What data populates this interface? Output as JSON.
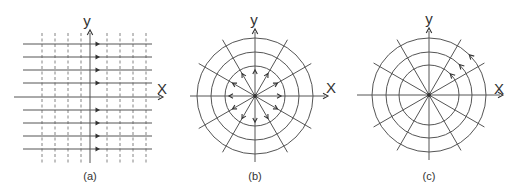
{
  "figure": {
    "width": 520,
    "height": 189,
    "colors": {
      "line": "#555555",
      "dashed": "#777777",
      "arrow": "#333333",
      "text": "#333333",
      "background": "#ffffff"
    }
  },
  "panels": [
    {
      "id": "a",
      "caption": "(a)",
      "description": "Uniform parallel flow: horizontal streamlines with arrows pointing in +x direction, dashed vertical equipotential lines",
      "x_label": "X",
      "y_label": "y",
      "origin": [
        90,
        97
      ],
      "x_axis": {
        "from": 14,
        "to": 163
      },
      "y_axis": {
        "from": 163,
        "to": 30
      },
      "streamlines_y": [
        44,
        57,
        70,
        83,
        110,
        123,
        136,
        149
      ],
      "streamline_span": [
        23,
        152
      ],
      "arrow_x": 97,
      "equipotential_x": [
        42,
        55,
        68,
        81,
        107,
        120,
        133,
        146
      ],
      "equipotential_span": [
        33,
        165
      ],
      "label_positions": {
        "y": [
          87,
          20
        ],
        "x": [
          162,
          88
        ],
        "caption": [
          90,
          176
        ]
      }
    },
    {
      "id": "b",
      "caption": "(b)",
      "description": "Source flow: radial streamlines with outward-pointing arrows, concentric circular equipotential lines",
      "x_label": "X",
      "y_label": "y",
      "center": [
        255,
        96
      ],
      "radii": [
        30,
        44,
        58
      ],
      "radial_length": 65,
      "radial_angles_deg": [
        0,
        30,
        60,
        90,
        120,
        150,
        180,
        210,
        240,
        270,
        300,
        330
      ],
      "arrow_radius": 26,
      "arrow_direction": "outward",
      "x_axis": {
        "from": 190,
        "to": 328
      },
      "y_axis": {
        "from": 162,
        "to": 29
      },
      "label_positions": {
        "y": [
          254,
          19
        ],
        "x": [
          331,
          87
        ],
        "caption": [
          255,
          176
        ]
      }
    },
    {
      "id": "c",
      "caption": "(c)",
      "description": "Vortex flow: circular streamlines with counterclockwise arrows, radial equipotential lines",
      "x_label": "X",
      "y_label": "y",
      "center": [
        429,
        95
      ],
      "radii": [
        30,
        43,
        57
      ],
      "radial_length": 64,
      "radial_angles_deg": [
        0,
        30,
        60,
        90,
        120,
        150,
        180,
        210,
        240,
        270,
        300,
        330
      ],
      "arrow_angle_deg": 45,
      "arrow_direction": "counterclockwise",
      "x_axis": {
        "from": 357,
        "to": 503
      },
      "y_axis": {
        "from": 160,
        "to": 28
      },
      "label_positions": {
        "y": [
          429,
          18
        ],
        "x": [
          499,
          88
        ],
        "caption": [
          429,
          176
        ]
      }
    }
  ]
}
